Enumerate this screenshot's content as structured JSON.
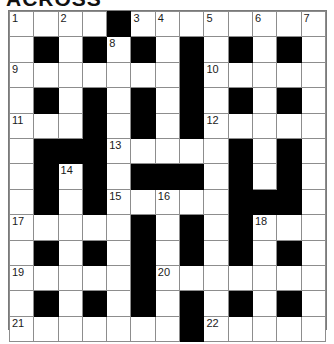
{
  "page": {
    "title_partial": "ACROSS",
    "kind": "crossword-grid"
  },
  "grid": {
    "rows": 13,
    "cols": 12,
    "block_color": "#000000",
    "cell_color": "#ffffff",
    "border_color": "#8d8d8d",
    "cells": [
      [
        {
          "type": "open",
          "number": "1"
        },
        {
          "type": "open",
          "number": ""
        },
        {
          "type": "open",
          "number": "2"
        },
        {
          "type": "open",
          "number": ""
        },
        {
          "type": "block",
          "number": ""
        },
        {
          "type": "open",
          "number": "3"
        },
        {
          "type": "open",
          "number": "4"
        },
        {
          "type": "open",
          "number": ""
        },
        {
          "type": "open",
          "number": "5"
        },
        {
          "type": "open",
          "number": ""
        },
        {
          "type": "open",
          "number": "6"
        },
        {
          "type": "open",
          "number": ""
        },
        {
          "type": "open",
          "number": "7"
        }
      ],
      [
        {
          "type": "open",
          "number": ""
        },
        {
          "type": "block",
          "number": ""
        },
        {
          "type": "open",
          "number": ""
        },
        {
          "type": "block",
          "number": ""
        },
        {
          "type": "open",
          "number": "8"
        },
        {
          "type": "block",
          "number": ""
        },
        {
          "type": "open",
          "number": ""
        },
        {
          "type": "block",
          "number": ""
        },
        {
          "type": "open",
          "number": ""
        },
        {
          "type": "block",
          "number": ""
        },
        {
          "type": "open",
          "number": ""
        },
        {
          "type": "block",
          "number": ""
        },
        {
          "type": "open",
          "number": ""
        }
      ],
      [
        {
          "type": "open",
          "number": "9"
        },
        {
          "type": "open",
          "number": ""
        },
        {
          "type": "open",
          "number": ""
        },
        {
          "type": "open",
          "number": ""
        },
        {
          "type": "open",
          "number": ""
        },
        {
          "type": "open",
          "number": ""
        },
        {
          "type": "open",
          "number": ""
        },
        {
          "type": "block",
          "number": ""
        },
        {
          "type": "open",
          "number": "10"
        },
        {
          "type": "open",
          "number": ""
        },
        {
          "type": "open",
          "number": ""
        },
        {
          "type": "open",
          "number": ""
        },
        {
          "type": "open",
          "number": ""
        }
      ],
      [
        {
          "type": "open",
          "number": ""
        },
        {
          "type": "block",
          "number": ""
        },
        {
          "type": "open",
          "number": ""
        },
        {
          "type": "block",
          "number": ""
        },
        {
          "type": "open",
          "number": ""
        },
        {
          "type": "block",
          "number": ""
        },
        {
          "type": "open",
          "number": ""
        },
        {
          "type": "block",
          "number": ""
        },
        {
          "type": "open",
          "number": ""
        },
        {
          "type": "block",
          "number": ""
        },
        {
          "type": "open",
          "number": ""
        },
        {
          "type": "block",
          "number": ""
        },
        {
          "type": "open",
          "number": ""
        }
      ],
      [
        {
          "type": "open",
          "number": "11"
        },
        {
          "type": "open",
          "number": ""
        },
        {
          "type": "open",
          "number": ""
        },
        {
          "type": "block",
          "number": ""
        },
        {
          "type": "open",
          "number": ""
        },
        {
          "type": "block",
          "number": ""
        },
        {
          "type": "open",
          "number": ""
        },
        {
          "type": "block",
          "number": ""
        },
        {
          "type": "open",
          "number": "12"
        },
        {
          "type": "open",
          "number": ""
        },
        {
          "type": "open",
          "number": ""
        },
        {
          "type": "open",
          "number": ""
        },
        {
          "type": "open",
          "number": ""
        }
      ],
      [
        {
          "type": "open",
          "number": ""
        },
        {
          "type": "block",
          "number": ""
        },
        {
          "type": "block",
          "number": ""
        },
        {
          "type": "block",
          "number": ""
        },
        {
          "type": "open",
          "number": "13"
        },
        {
          "type": "open",
          "number": ""
        },
        {
          "type": "open",
          "number": ""
        },
        {
          "type": "open",
          "number": ""
        },
        {
          "type": "open",
          "number": ""
        },
        {
          "type": "block",
          "number": ""
        },
        {
          "type": "open",
          "number": ""
        },
        {
          "type": "block",
          "number": ""
        },
        {
          "type": "open",
          "number": ""
        }
      ],
      [
        {
          "type": "open",
          "number": ""
        },
        {
          "type": "block",
          "number": ""
        },
        {
          "type": "open",
          "number": "14"
        },
        {
          "type": "block",
          "number": ""
        },
        {
          "type": "open",
          "number": ""
        },
        {
          "type": "block",
          "number": ""
        },
        {
          "type": "block",
          "number": ""
        },
        {
          "type": "block",
          "number": ""
        },
        {
          "type": "open",
          "number": ""
        },
        {
          "type": "block",
          "number": ""
        },
        {
          "type": "open",
          "number": ""
        },
        {
          "type": "block",
          "number": ""
        },
        {
          "type": "open",
          "number": ""
        }
      ],
      [
        {
          "type": "open",
          "number": ""
        },
        {
          "type": "block",
          "number": ""
        },
        {
          "type": "open",
          "number": ""
        },
        {
          "type": "block",
          "number": ""
        },
        {
          "type": "open",
          "number": "15"
        },
        {
          "type": "open",
          "number": ""
        },
        {
          "type": "open",
          "number": "16"
        },
        {
          "type": "open",
          "number": ""
        },
        {
          "type": "open",
          "number": ""
        },
        {
          "type": "block",
          "number": ""
        },
        {
          "type": "block",
          "number": ""
        },
        {
          "type": "block",
          "number": ""
        },
        {
          "type": "open",
          "number": ""
        }
      ],
      [
        {
          "type": "open",
          "number": "17"
        },
        {
          "type": "open",
          "number": ""
        },
        {
          "type": "open",
          "number": ""
        },
        {
          "type": "open",
          "number": ""
        },
        {
          "type": "open",
          "number": ""
        },
        {
          "type": "block",
          "number": ""
        },
        {
          "type": "open",
          "number": ""
        },
        {
          "type": "block",
          "number": ""
        },
        {
          "type": "open",
          "number": ""
        },
        {
          "type": "block",
          "number": ""
        },
        {
          "type": "open",
          "number": "18"
        },
        {
          "type": "open",
          "number": ""
        },
        {
          "type": "open",
          "number": ""
        }
      ],
      [
        {
          "type": "open",
          "number": ""
        },
        {
          "type": "block",
          "number": ""
        },
        {
          "type": "open",
          "number": ""
        },
        {
          "type": "block",
          "number": ""
        },
        {
          "type": "open",
          "number": ""
        },
        {
          "type": "block",
          "number": ""
        },
        {
          "type": "open",
          "number": ""
        },
        {
          "type": "block",
          "number": ""
        },
        {
          "type": "open",
          "number": ""
        },
        {
          "type": "block",
          "number": ""
        },
        {
          "type": "open",
          "number": ""
        },
        {
          "type": "block",
          "number": ""
        },
        {
          "type": "open",
          "number": ""
        }
      ],
      [
        {
          "type": "open",
          "number": "19"
        },
        {
          "type": "open",
          "number": ""
        },
        {
          "type": "open",
          "number": ""
        },
        {
          "type": "open",
          "number": ""
        },
        {
          "type": "open",
          "number": ""
        },
        {
          "type": "block",
          "number": ""
        },
        {
          "type": "open",
          "number": "20"
        },
        {
          "type": "open",
          "number": ""
        },
        {
          "type": "open",
          "number": ""
        },
        {
          "type": "open",
          "number": ""
        },
        {
          "type": "open",
          "number": ""
        },
        {
          "type": "open",
          "number": ""
        },
        {
          "type": "open",
          "number": ""
        }
      ],
      [
        {
          "type": "open",
          "number": ""
        },
        {
          "type": "block",
          "number": ""
        },
        {
          "type": "open",
          "number": ""
        },
        {
          "type": "block",
          "number": ""
        },
        {
          "type": "open",
          "number": ""
        },
        {
          "type": "block",
          "number": ""
        },
        {
          "type": "open",
          "number": ""
        },
        {
          "type": "block",
          "number": ""
        },
        {
          "type": "open",
          "number": ""
        },
        {
          "type": "block",
          "number": ""
        },
        {
          "type": "open",
          "number": ""
        },
        {
          "type": "block",
          "number": ""
        },
        {
          "type": "open",
          "number": ""
        }
      ],
      [
        {
          "type": "open",
          "number": "21"
        },
        {
          "type": "open",
          "number": ""
        },
        {
          "type": "open",
          "number": ""
        },
        {
          "type": "open",
          "number": ""
        },
        {
          "type": "open",
          "number": ""
        },
        {
          "type": "open",
          "number": ""
        },
        {
          "type": "open",
          "number": ""
        },
        {
          "type": "block",
          "number": ""
        },
        {
          "type": "open",
          "number": "22"
        },
        {
          "type": "open",
          "number": ""
        },
        {
          "type": "open",
          "number": ""
        },
        {
          "type": "open",
          "number": ""
        },
        {
          "type": "open",
          "number": ""
        }
      ]
    ]
  }
}
